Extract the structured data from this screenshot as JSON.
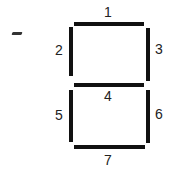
{
  "diagram": {
    "title": "",
    "type": "seven-segment-display",
    "segments": [
      {
        "id": 1,
        "label": "1",
        "orientation": "horizontal",
        "position": "top"
      },
      {
        "id": 2,
        "label": "2",
        "orientation": "vertical",
        "position": "upper-left"
      },
      {
        "id": 3,
        "label": "3",
        "orientation": "vertical",
        "position": "upper-right"
      },
      {
        "id": 4,
        "label": "4",
        "orientation": "horizontal",
        "position": "middle"
      },
      {
        "id": 5,
        "label": "5",
        "orientation": "vertical",
        "position": "lower-left"
      },
      {
        "id": 6,
        "label": "6",
        "orientation": "vertical",
        "position": "lower-right"
      },
      {
        "id": 7,
        "label": "7",
        "orientation": "horizontal",
        "position": "bottom"
      }
    ],
    "colors": {
      "segment": "#111111",
      "background": "#ffffff",
      "text": "#222222"
    }
  }
}
